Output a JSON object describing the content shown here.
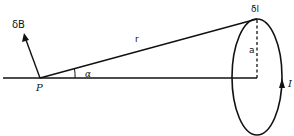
{
  "diagram": {
    "labels": {
      "field_element": "δB",
      "radius_vector": "r",
      "angle": "α",
      "point": "P",
      "current_element": "δl",
      "loop_radius": "a",
      "current": "I"
    },
    "colors": {
      "stroke": "#111111",
      "background": "#ffffff"
    },
    "geometry": {
      "axis": {
        "x1": 3,
        "y1": 78,
        "x2": 257,
        "y2": 78
      },
      "point_P": {
        "x": 40,
        "y": 78
      },
      "loop_center": {
        "x": 257,
        "y": 78
      },
      "loop_rx": 25,
      "loop_ry": 59,
      "loop_top": {
        "x": 257,
        "y": 19
      },
      "dB_tip": {
        "x": 24,
        "y": 34
      }
    },
    "elements": [
      {
        "name": "axis-line",
        "type": "line"
      },
      {
        "name": "r-line",
        "type": "line",
        "from": "P",
        "to": "δl"
      },
      {
        "name": "dB-arrow",
        "type": "arrow",
        "from": "P"
      },
      {
        "name": "alpha-arc",
        "type": "arc",
        "at": "P"
      },
      {
        "name": "current-loop",
        "type": "ellipse"
      },
      {
        "name": "radius-a-dashed",
        "type": "dashed-line"
      },
      {
        "name": "current-direction-arrow",
        "type": "arrowhead",
        "direction": "up"
      }
    ]
  }
}
